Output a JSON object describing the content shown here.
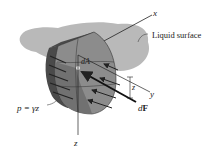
{
  "figure": {
    "type": "hydrostatic pressure on a curved submerged surface",
    "labels": {
      "x_axis": "x",
      "y_axis": "y",
      "z_axis": "z",
      "z_depth": "z",
      "liquid_surface": "Liquid surface",
      "area_element": "dA",
      "force_d": "d",
      "force_F": "F",
      "pressure_eq": "p = γz"
    },
    "colors": {
      "liquid_surface": "#b9b9b9",
      "plate_face": "#8c8c8c",
      "plate_front": "#6e6e6e",
      "plate_edge": "#4a4a4a",
      "plate_dark_stripe": "#333333",
      "highlight": "#e8e8e8",
      "line": "#222222"
    }
  }
}
